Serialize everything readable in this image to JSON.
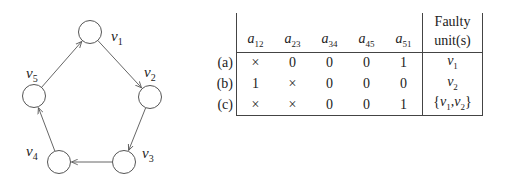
{
  "graph": {
    "nodes": [
      {
        "id": "v1",
        "label": "v",
        "sub": "1"
      },
      {
        "id": "v2",
        "label": "v",
        "sub": "2"
      },
      {
        "id": "v3",
        "label": "v",
        "sub": "3"
      },
      {
        "id": "v4",
        "label": "v",
        "sub": "4"
      },
      {
        "id": "v5",
        "label": "v",
        "sub": "5"
      }
    ],
    "edges": [
      {
        "from": "v1",
        "to": "v2"
      },
      {
        "from": "v2",
        "to": "v3"
      },
      {
        "from": "v3",
        "to": "v4"
      },
      {
        "from": "v4",
        "to": "v5"
      },
      {
        "from": "v5",
        "to": "v1"
      }
    ]
  },
  "table": {
    "header_top": "Faulty",
    "header_bottom": "unit(s)",
    "columns": [
      {
        "var": "a",
        "sub": "12"
      },
      {
        "var": "a",
        "sub": "23"
      },
      {
        "var": "a",
        "sub": "34"
      },
      {
        "var": "a",
        "sub": "45"
      },
      {
        "var": "a",
        "sub": "51"
      }
    ],
    "rows": [
      {
        "label": "(a)",
        "values": [
          "×",
          "0",
          "0",
          "0",
          "1"
        ],
        "fault_prefix": "",
        "fault": [
          {
            "v": "v",
            "s": "1"
          }
        ],
        "fault_suffix": ""
      },
      {
        "label": "(b)",
        "values": [
          "1",
          "×",
          "0",
          "0",
          "0"
        ],
        "fault_prefix": "",
        "fault": [
          {
            "v": "v",
            "s": "2"
          }
        ],
        "fault_suffix": ""
      },
      {
        "label": "(c)",
        "values": [
          "×",
          "×",
          "0",
          "0",
          "1"
        ],
        "fault_prefix": "{",
        "fault": [
          {
            "v": "v",
            "s": "1"
          },
          {
            "v": "v",
            "s": "2"
          }
        ],
        "fault_suffix": "}"
      }
    ]
  }
}
